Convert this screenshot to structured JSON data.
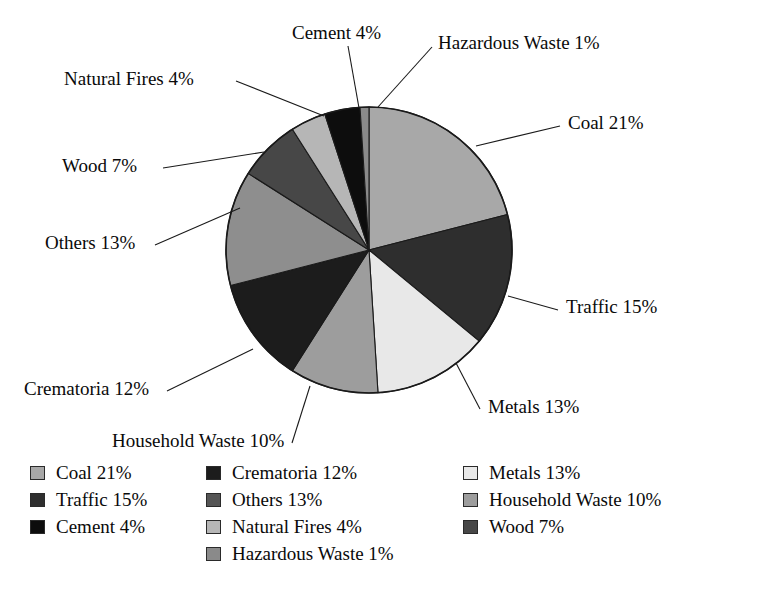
{
  "chart_data": {
    "type": "pie",
    "title": "",
    "subtitle": "",
    "xlabel": "",
    "ylabel": "",
    "grid": false,
    "legend_position": "bottom",
    "units": "percent",
    "total": 100,
    "start_angle_deg": 0,
    "direction": "clockwise",
    "categories": [
      "Coal",
      "Traffic",
      "Metals",
      "Household Waste",
      "Crematoria",
      "Others",
      "Wood",
      "Natural Fires",
      "Cement",
      "Hazardous Waste"
    ],
    "values": [
      21,
      15,
      13,
      10,
      12,
      13,
      7,
      4,
      4,
      1
    ],
    "slices": [
      {
        "label": "Coal",
        "value": 21,
        "display": "Coal 21%",
        "color": "#a8a8a8",
        "start_deg": 0,
        "end_deg": 75.6
      },
      {
        "label": "Traffic",
        "value": 15,
        "display": "Traffic 15%",
        "color": "#2e2e2e",
        "start_deg": 75.6,
        "end_deg": 129.6
      },
      {
        "label": "Metals",
        "value": 13,
        "display": "Metals 13%",
        "color": "#e8e8e8",
        "start_deg": 129.6,
        "end_deg": 176.4
      },
      {
        "label": "Household Waste",
        "value": 10,
        "display": "Household Waste 10%",
        "color": "#9d9d9d",
        "start_deg": 176.4,
        "end_deg": 212.4
      },
      {
        "label": "Crematoria",
        "value": 12,
        "display": "Crematoria 12%",
        "color": "#1c1c1c",
        "start_deg": 212.4,
        "end_deg": 255.6
      },
      {
        "label": "Others",
        "value": 13,
        "display": "Others 13%",
        "color": "#8e8e8e",
        "start_deg": 255.6,
        "end_deg": 302.4
      },
      {
        "label": "Wood",
        "value": 7,
        "display": "Wood 7%",
        "color": "#474747",
        "start_deg": 302.4,
        "end_deg": 327.6
      },
      {
        "label": "Natural Fires",
        "value": 4,
        "display": "Natural Fires 4%",
        "color": "#b6b6b6",
        "start_deg": 327.6,
        "end_deg": 342.0
      },
      {
        "label": "Cement",
        "value": 4,
        "display": "Cement 4%",
        "color": "#0d0d0d",
        "start_deg": 342.0,
        "end_deg": 356.4
      },
      {
        "label": "Hazardous Waste",
        "value": 1,
        "display": "Hazardous Waste 1%",
        "color": "#8a8a8a",
        "start_deg": 356.4,
        "end_deg": 360.0
      }
    ]
  },
  "pie": {
    "center_x": 369,
    "center_y": 250,
    "radius": 143,
    "outline_color": "#1a1a1a"
  },
  "callouts": [
    {
      "name": "cement",
      "text": "Cement 4%",
      "x": 292,
      "y": 22,
      "anchor": "start",
      "line": [
        [
          348,
          46
        ],
        [
          359,
          108
        ]
      ]
    },
    {
      "name": "hazardous-waste",
      "text": "Hazardous Waste 1%",
      "x": 438,
      "y": 32,
      "anchor": "start",
      "line": [
        [
          432,
          47
        ],
        [
          378,
          107
        ]
      ]
    },
    {
      "name": "natural-fires",
      "text": "Natural Fires 4%",
      "x": 64,
      "y": 68,
      "anchor": "start",
      "line": [
        [
          236,
          81
        ],
        [
          324,
          116
        ]
      ]
    },
    {
      "name": "coal",
      "text": "Coal 21%",
      "x": 568,
      "y": 112,
      "anchor": "start",
      "line": [
        [
          560,
          126
        ],
        [
          476,
          146
        ]
      ]
    },
    {
      "name": "wood",
      "text": "Wood 7%",
      "x": 62,
      "y": 155,
      "anchor": "start",
      "line": [
        [
          163,
          168
        ],
        [
          264,
          152
        ]
      ]
    },
    {
      "name": "others",
      "text": "Others 13%",
      "x": 45,
      "y": 232,
      "anchor": "start",
      "line": [
        [
          155,
          245
        ],
        [
          240,
          208
        ]
      ]
    },
    {
      "name": "traffic",
      "text": "Traffic 15%",
      "x": 566,
      "y": 296,
      "anchor": "start",
      "line": [
        [
          558,
          310
        ],
        [
          508,
          296
        ]
      ]
    },
    {
      "name": "metals",
      "text": "Metals 13%",
      "x": 488,
      "y": 396,
      "anchor": "start",
      "line": [
        [
          480,
          409
        ],
        [
          456,
          363
        ]
      ]
    },
    {
      "name": "crematoria",
      "text": "Crematoria 12%",
      "x": 24,
      "y": 378,
      "anchor": "start",
      "line": [
        [
          167,
          391
        ],
        [
          253,
          349
        ]
      ]
    },
    {
      "name": "household-waste",
      "text": "Household Waste 10%",
      "x": 112,
      "y": 430,
      "anchor": "start",
      "line": [
        [
          292,
          443
        ],
        [
          310,
          386
        ]
      ]
    }
  ],
  "legend": {
    "columns": [
      {
        "name": "legend-column-1",
        "items": [
          {
            "label": "Coal 21%",
            "color": "#a8a8a8"
          },
          {
            "label": "Traffic 15%",
            "color": "#2e2e2e"
          },
          {
            "label": "Cement 4%",
            "color": "#0d0d0d"
          }
        ]
      },
      {
        "name": "legend-column-2",
        "items": [
          {
            "label": "Crematoria 12%",
            "color": "#1c1c1c"
          },
          {
            "label": "Others 13%",
            "color": "#555555"
          },
          {
            "label": "Natural Fires 4%",
            "color": "#b6b6b6"
          },
          {
            "label": "Hazardous Waste 1%",
            "color": "#8a8a8a"
          }
        ]
      },
      {
        "name": "legend-column-3",
        "items": [
          {
            "label": "Metals 13%",
            "color": "#e8e8e8"
          },
          {
            "label": "Household Waste 10%",
            "color": "#9d9d9d"
          },
          {
            "label": "Wood 7%",
            "color": "#474747"
          }
        ]
      }
    ]
  }
}
